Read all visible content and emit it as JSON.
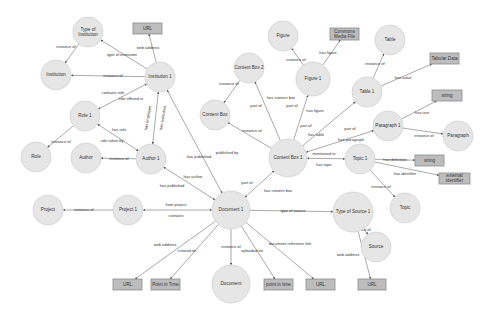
{
  "diagram": {
    "colors": {
      "circle_fill": "#e6e6e6",
      "box_fill": "#bdbdbd",
      "edge": "#6f6f6f",
      "text": "#333333",
      "background": "#ffffff"
    },
    "nodes": [
      {
        "id": "type_of_institution",
        "label": [
          "Type of",
          "Institution"
        ],
        "shape": "circle",
        "x": 88,
        "y": 32,
        "r": 15
      },
      {
        "id": "url_inst",
        "label": [
          "URL"
        ],
        "shape": "box",
        "x": 133,
        "y": 23,
        "w": 29,
        "h": 11
      },
      {
        "id": "institution",
        "label": [
          "Institution"
        ],
        "shape": "circle",
        "x": 56,
        "y": 75,
        "r": 15
      },
      {
        "id": "institution_1",
        "label": [
          "Institution 1"
        ],
        "shape": "circle",
        "x": 160,
        "y": 77,
        "r": 15
      },
      {
        "id": "role_1",
        "label": [
          "Role 1"
        ],
        "shape": "circle",
        "x": 85,
        "y": 116,
        "r": 15
      },
      {
        "id": "role",
        "label": [
          "Role"
        ],
        "shape": "circle",
        "x": 36,
        "y": 157,
        "r": 15
      },
      {
        "id": "author",
        "label": [
          "Author"
        ],
        "shape": "circle",
        "x": 86,
        "y": 158,
        "r": 15
      },
      {
        "id": "author_1",
        "label": [
          "Author 1"
        ],
        "shape": "circle",
        "x": 151,
        "y": 159,
        "r": 15
      },
      {
        "id": "project",
        "label": [
          "Project"
        ],
        "shape": "circle",
        "x": 48,
        "y": 210,
        "r": 15
      },
      {
        "id": "project_1",
        "label": [
          "Project 1"
        ],
        "shape": "circle",
        "x": 128,
        "y": 210,
        "r": 15
      },
      {
        "id": "document_1",
        "label": [
          "Document 1"
        ],
        "shape": "circle",
        "x": 231,
        "y": 210,
        "r": 19
      },
      {
        "id": "document",
        "label": [
          "Document"
        ],
        "shape": "circle",
        "x": 231,
        "y": 284,
        "r": 19
      },
      {
        "id": "url_doc",
        "label": [
          "URL"
        ],
        "shape": "box",
        "x": 113,
        "y": 279,
        "w": 29,
        "h": 11
      },
      {
        "id": "point_in_time_box",
        "label": [
          "Point in Time"
        ],
        "shape": "box",
        "x": 151,
        "y": 279,
        "w": 29,
        "h": 11
      },
      {
        "id": "point_in_time_lower",
        "label": [
          "point in time"
        ],
        "shape": "box",
        "x": 264,
        "y": 279,
        "w": 29,
        "h": 11
      },
      {
        "id": "url_docref",
        "label": [
          "URL"
        ],
        "shape": "box",
        "x": 306,
        "y": 279,
        "w": 29,
        "h": 11
      },
      {
        "id": "type_of_source_1",
        "label": [
          "Type of Source 1"
        ],
        "shape": "circle",
        "x": 353,
        "y": 212,
        "r": 20
      },
      {
        "id": "source",
        "label": [
          "Source"
        ],
        "shape": "circle",
        "x": 376,
        "y": 247,
        "r": 15
      },
      {
        "id": "url_source",
        "label": [
          "URL"
        ],
        "shape": "box",
        "x": 358,
        "y": 279,
        "w": 28,
        "h": 11
      },
      {
        "id": "content_box_1",
        "label": [
          "Content Box 1"
        ],
        "shape": "circle",
        "x": 288,
        "y": 158,
        "r": 19
      },
      {
        "id": "topic_1",
        "label": [
          "Topic 1"
        ],
        "shape": "circle",
        "x": 360,
        "y": 159,
        "r": 15
      },
      {
        "id": "string_topic",
        "label": [
          "string"
        ],
        "shape": "box",
        "x": 415,
        "y": 155,
        "w": 29,
        "h": 11
      },
      {
        "id": "external_identifier",
        "label": [
          "external",
          "identifier"
        ],
        "shape": "box",
        "x": 439,
        "y": 173,
        "w": 31,
        "h": 11
      },
      {
        "id": "topic",
        "label": [
          "Topic"
        ],
        "shape": "circle",
        "x": 405,
        "y": 208,
        "r": 15
      },
      {
        "id": "content_box",
        "label": [
          "Content Box"
        ],
        "shape": "circle",
        "x": 215,
        "y": 115,
        "r": 15
      },
      {
        "id": "content_box_2",
        "label": [
          "Content Box 2"
        ],
        "shape": "circle",
        "x": 249,
        "y": 68,
        "r": 15
      },
      {
        "id": "figure",
        "label": [
          "Figure"
        ],
        "shape": "circle",
        "x": 283,
        "y": 36,
        "r": 15
      },
      {
        "id": "figure_1",
        "label": [
          "Figure 1"
        ],
        "shape": "circle",
        "x": 313,
        "y": 79,
        "r": 17
      },
      {
        "id": "commons_media_file",
        "label": [
          "Commons",
          "Media File"
        ],
        "shape": "box",
        "x": 330,
        "y": 28,
        "w": 29,
        "h": 12
      },
      {
        "id": "table",
        "label": [
          "Table"
        ],
        "shape": "circle",
        "x": 390,
        "y": 40,
        "r": 15
      },
      {
        "id": "table_1",
        "label": [
          "Table 1"
        ],
        "shape": "circle",
        "x": 367,
        "y": 92,
        "r": 15
      },
      {
        "id": "tabular_data",
        "label": [
          "Tabular Data"
        ],
        "shape": "box",
        "x": 430,
        "y": 53,
        "w": 29,
        "h": 11
      },
      {
        "id": "string_para",
        "label": [
          "string"
        ],
        "shape": "box",
        "x": 432,
        "y": 90,
        "w": 30,
        "h": 11
      },
      {
        "id": "paragraph_1",
        "label": [
          "Paragraph 1"
        ],
        "shape": "circle",
        "x": 388,
        "y": 126,
        "r": 15
      },
      {
        "id": "paragraph",
        "label": [
          "Paragraph"
        ],
        "shape": "circle",
        "x": 458,
        "y": 136,
        "r": 15
      }
    ],
    "edges": [
      {
        "from": "type_of_institution",
        "to": "institution",
        "label": "instance of",
        "lx": 66,
        "ly": 47,
        "start": "head"
      },
      {
        "from": "institution_1",
        "to": "type_of_institution",
        "label": "type of institution",
        "lx": 122,
        "ly": 55
      },
      {
        "from": "institution_1",
        "to": "url_inst",
        "label": "web address",
        "lx": 148,
        "ly": 48
      },
      {
        "from": "institution_1",
        "to": "institution",
        "label": "instance of",
        "lx": 113,
        "ly": 76
      },
      {
        "from": "institution_1",
        "to": "role_1",
        "label": "contains role",
        "lx": 113,
        "ly": 93,
        "both": true
      },
      {
        "from": "role_1",
        "to": "institution_1",
        "label": "role offered in",
        "lx": 131,
        "ly": 99,
        "hidden_arrow": true
      },
      {
        "from": "institution_1",
        "to": "author_1",
        "label": "has employee",
        "lx": 148,
        "ly": 118,
        "rotate": -80,
        "both": true
      },
      {
        "from": "author_1",
        "to": "institution_1",
        "label": "has institution",
        "lx": 163,
        "ly": 118,
        "rotate": -80,
        "hidden_arrow": true
      },
      {
        "from": "role_1",
        "to": "role",
        "label": "instance of",
        "lx": 61,
        "ly": 142
      },
      {
        "from": "role_1",
        "to": "author_1",
        "label": "has role",
        "lx": 119,
        "ly": 130,
        "both": true
      },
      {
        "from": "author_1",
        "to": "role_1",
        "label": "role taken by",
        "lx": 112,
        "ly": 141,
        "hidden_arrow": true
      },
      {
        "from": "author_1",
        "to": "author",
        "label": "instance of",
        "lx": 119,
        "ly": 159
      },
      {
        "from": "document_1",
        "to": "institution_1",
        "label": "published by",
        "lx": 227,
        "ly": 153,
        "both": true
      },
      {
        "from": "institution_1",
        "to": "document_1",
        "label": "has published",
        "lx": 199,
        "ly": 157,
        "hidden_arrow": true
      },
      {
        "from": "author_1",
        "to": "document_1",
        "label": "has author",
        "lx": 193,
        "ly": 177,
        "both": true
      },
      {
        "from": "document_1",
        "to": "author_1",
        "label": "has published",
        "lx": 172,
        "ly": 186,
        "hidden_arrow": true
      },
      {
        "from": "project_1",
        "to": "project",
        "label": "instance of",
        "lx": 84,
        "ly": 210
      },
      {
        "from": "project_1",
        "to": "document_1",
        "label": "from project",
        "lx": 176,
        "ly": 205,
        "both": true
      },
      {
        "from": "document_1",
        "to": "project_1",
        "label": "contains",
        "lx": 176,
        "ly": 216,
        "hidden_arrow": true
      },
      {
        "from": "document_1",
        "to": "url_doc",
        "label": "web address",
        "lx": 165,
        "ly": 245
      },
      {
        "from": "document_1",
        "to": "point_in_time_box",
        "label": "created on",
        "lx": 187,
        "ly": 251
      },
      {
        "from": "document_1",
        "to": "document",
        "label": "instance of",
        "lx": 231,
        "ly": 247
      },
      {
        "from": "document_1",
        "to": "point_in_time_lower",
        "label": "uploaded on",
        "lx": 252,
        "ly": 251
      },
      {
        "from": "document_1",
        "to": "url_docref",
        "label": "document reference link",
        "lx": 290,
        "ly": 244
      },
      {
        "from": "document_1",
        "to": "type_of_source_1",
        "label": "type of source",
        "lx": 293,
        "ly": 211
      },
      {
        "from": "type_of_source_1",
        "to": "source",
        "label": "instance of",
        "lx": 361,
        "ly": 230
      },
      {
        "from": "type_of_source_1",
        "to": "url_source",
        "label": "web address",
        "lx": 348,
        "ly": 255
      },
      {
        "from": "document_1",
        "to": "content_box_1",
        "label": "part of",
        "lx": 247,
        "ly": 183,
        "both": true
      },
      {
        "from": "content_box_1",
        "to": "document_1",
        "label": "has content box",
        "lx": 278,
        "ly": 191,
        "hidden_arrow": true
      },
      {
        "from": "content_box_1",
        "to": "topic_1",
        "label": "mentioned in",
        "lx": 324,
        "ly": 154,
        "both": true
      },
      {
        "from": "topic_1",
        "to": "content_box_1",
        "label": "has topic",
        "lx": 324,
        "ly": 165,
        "hidden_arrow": true
      },
      {
        "from": "topic_1",
        "to": "string_topic",
        "label": "has definition",
        "lx": 395,
        "ly": 160
      },
      {
        "from": "topic_1",
        "to": "external_identifier",
        "label": "has identifier",
        "lx": 405,
        "ly": 174
      },
      {
        "from": "topic_1",
        "to": "topic",
        "label": "instance of",
        "lx": 381,
        "ly": 187
      },
      {
        "from": "content_box_1",
        "to": "content_box",
        "label": "instance of",
        "lx": 252,
        "ly": 131
      },
      {
        "from": "content_box_1",
        "to": "content_box_2",
        "label": "has content box",
        "lx": 281,
        "ly": 98
      },
      {
        "from": "content_box_2",
        "to": "content_box_1",
        "label": "part of",
        "lx": 256,
        "ly": 106,
        "hidden_arrow": true
      },
      {
        "from": "content_box_2",
        "to": "content_box",
        "label": "instance of",
        "lx": 229,
        "ly": 84
      },
      {
        "from": "content_box_1",
        "to": "figure_1",
        "label": "part of",
        "lx": 292,
        "ly": 106
      },
      {
        "from": "figure_1",
        "to": "content_box_1",
        "label": "has figure",
        "lx": 315,
        "ly": 111,
        "hidden_arrow": true
      },
      {
        "from": "figure_1",
        "to": "figure",
        "label": "instance of",
        "lx": 296,
        "ly": 60
      },
      {
        "from": "figure_1",
        "to": "commons_media_file",
        "label": "has figure",
        "lx": 328,
        "ly": 53
      },
      {
        "from": "content_box_1",
        "to": "table_1",
        "label": "part of",
        "lx": 306,
        "ly": 126
      },
      {
        "from": "table_1",
        "to": "content_box_1",
        "label": "has table",
        "lx": 316,
        "ly": 135,
        "hidden_arrow": true
      },
      {
        "from": "table_1",
        "to": "table",
        "label": "instance of",
        "lx": 375,
        "ly": 64
      },
      {
        "from": "table_1",
        "to": "tabular_data",
        "label": "has value",
        "lx": 403,
        "ly": 78
      },
      {
        "from": "content_box_1",
        "to": "paragraph_1",
        "label": "part of",
        "lx": 350,
        "ly": 129,
        "both": true
      },
      {
        "from": "paragraph_1",
        "to": "content_box_1",
        "label": "has paragraph",
        "lx": 351,
        "ly": 140,
        "hidden_arrow": true
      },
      {
        "from": "paragraph_1",
        "to": "string_para",
        "label": "has text",
        "lx": 422,
        "ly": 113
      },
      {
        "from": "paragraph_1",
        "to": "paragraph",
        "label": "instance of",
        "lx": 424,
        "ly": 136
      }
    ]
  }
}
